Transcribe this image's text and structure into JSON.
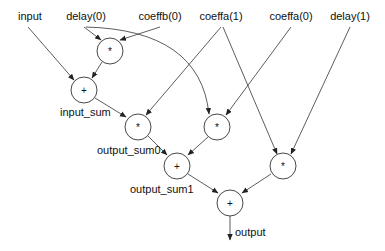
{
  "diagram": {
    "type": "dataflow-graph",
    "inputs": [
      {
        "id": "input",
        "label": "input",
        "x": 30,
        "y": 20
      },
      {
        "id": "delay0",
        "label": "delay(0)",
        "x": 86,
        "y": 20
      },
      {
        "id": "coeffb0",
        "label": "coeffb(0)",
        "x": 160,
        "y": 20
      },
      {
        "id": "coeffa1",
        "label": "coeffa(1)",
        "x": 221,
        "y": 20
      },
      {
        "id": "coeffa0",
        "label": "coeffa(0)",
        "x": 291,
        "y": 20
      },
      {
        "id": "delay1",
        "label": "delay(1)",
        "x": 350,
        "y": 20
      }
    ],
    "nodes": [
      {
        "id": "m1",
        "op": "*",
        "x": 110,
        "y": 51
      },
      {
        "id": "a1",
        "op": "+",
        "x": 84,
        "y": 90,
        "label": "input_sum"
      },
      {
        "id": "m2",
        "op": "*",
        "x": 138,
        "y": 127,
        "label": "output_sum0"
      },
      {
        "id": "m3",
        "op": "*",
        "x": 217,
        "y": 127
      },
      {
        "id": "a2",
        "op": "+",
        "x": 177,
        "y": 166,
        "label": "output_sum1"
      },
      {
        "id": "m4",
        "op": "*",
        "x": 283,
        "y": 166
      },
      {
        "id": "a3",
        "op": "+",
        "x": 230,
        "y": 203
      }
    ],
    "edge_labels": {
      "input_sum": "input_sum",
      "output_sum0": "output_sum0",
      "output_sum1": "output_sum1",
      "output": "output"
    },
    "edges": [
      [
        "input",
        "a1"
      ],
      [
        "delay0",
        "m1"
      ],
      [
        "coeffb0",
        "m1"
      ],
      [
        "m1",
        "a1"
      ],
      [
        "a1",
        "m2"
      ],
      [
        "coeffa1",
        "m2"
      ],
      [
        "delay0",
        "m3"
      ],
      [
        "coeffa0",
        "m3"
      ],
      [
        "m2",
        "a2"
      ],
      [
        "m3",
        "a2"
      ],
      [
        "coeffa1",
        "m4"
      ],
      [
        "delay1",
        "m4"
      ],
      [
        "a2",
        "a3"
      ],
      [
        "m4",
        "a3"
      ],
      [
        "a3",
        "output"
      ]
    ]
  }
}
